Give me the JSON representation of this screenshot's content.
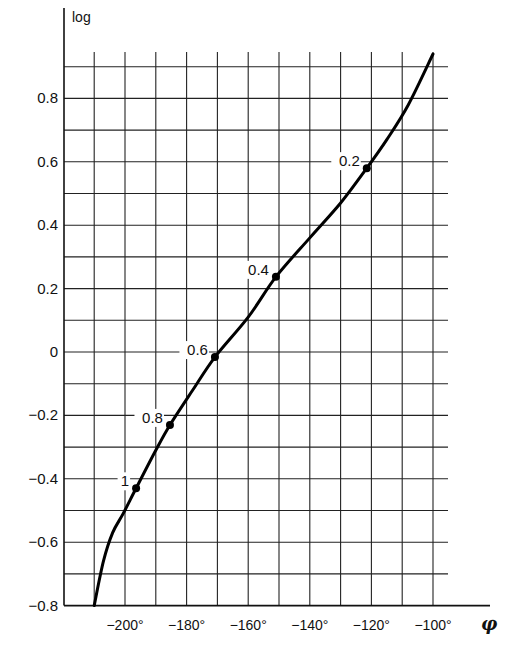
{
  "chart_data": {
    "type": "line",
    "title": "",
    "xlabel": "φ",
    "ylabel": "log",
    "xlim": [
      -210,
      -100
    ],
    "ylim": [
      -0.8,
      0.9
    ],
    "grid": true,
    "x_ticks": [
      -200,
      -180,
      -160,
      -140,
      -120,
      -100
    ],
    "x_tick_labels": [
      "−200°",
      "−180°",
      "−160°",
      "−140°",
      "−120°",
      "−100°"
    ],
    "y_ticks": [
      0.8,
      0.6,
      0.4,
      0.2,
      0,
      -0.2,
      -0.4,
      -0.6,
      -0.8
    ],
    "y_tick_labels": [
      "0.8",
      "0.6",
      "0.4",
      "0.2",
      "0",
      "−0.2",
      "−0.4",
      "−0.6",
      "−0.8"
    ],
    "series": [
      {
        "name": "curve",
        "x": [
          -210,
          -207,
          -204,
          -200.6,
          -196.4,
          -190,
          -185.4,
          -178,
          -170.8,
          -160,
          -151,
          -140,
          -130,
          -121.5,
          -115,
          -108,
          -100
        ],
        "y": [
          -0.8,
          -0.66,
          -0.57,
          -0.51,
          -0.43,
          -0.31,
          -0.23,
          -0.12,
          -0.016,
          0.11,
          0.237,
          0.36,
          0.47,
          0.58,
          0.67,
          0.78,
          0.94
        ]
      }
    ],
    "annotations": [
      {
        "label": "1",
        "x": -196.4,
        "y": -0.43
      },
      {
        "label": "0.8",
        "x": -185.4,
        "y": -0.23
      },
      {
        "label": "0.6",
        "x": -170.8,
        "y": -0.016
      },
      {
        "label": "0.4",
        "x": -151.0,
        "y": 0.237
      },
      {
        "label": "0.2",
        "x": -121.5,
        "y": 0.58
      }
    ]
  },
  "labels": {
    "y_axis": "log",
    "x_axis": "φ"
  }
}
